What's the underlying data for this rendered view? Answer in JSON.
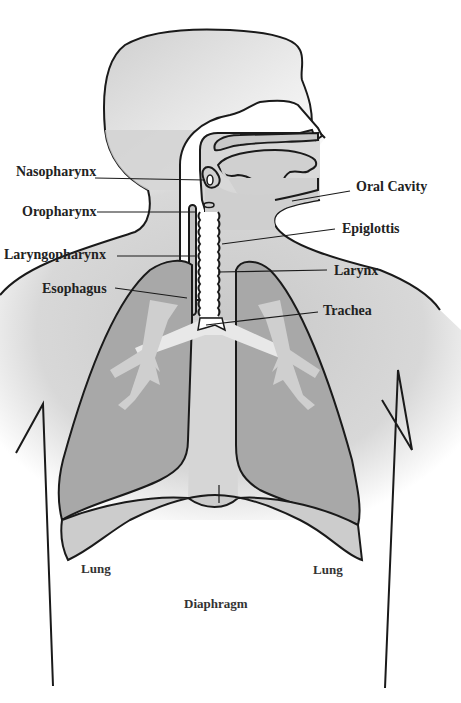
{
  "diagram": {
    "colors": {
      "outline": "#1a1a1a",
      "body_fill": "#d4d4d4",
      "lung_fill": "#a6a6a6",
      "airway_fill": "#ffffff",
      "bronchi_fill": "#cfcfcf",
      "diaphragm_fill": "#cccccc",
      "label_color": "#222222"
    },
    "labels": {
      "nasopharynx": "Nasopharynx",
      "oropharynx": "Oropharynx",
      "laryngopharynx": "Laryngopharynx",
      "esophagus": "Esophagus",
      "oral_cavity": "Oral Cavity",
      "epiglottis": "Epiglottis",
      "larynx": "Larynx",
      "trachea": "Trachea",
      "lung_left": "Lung",
      "lung_right": "Lung",
      "diaphragm": "Diaphragm"
    }
  }
}
